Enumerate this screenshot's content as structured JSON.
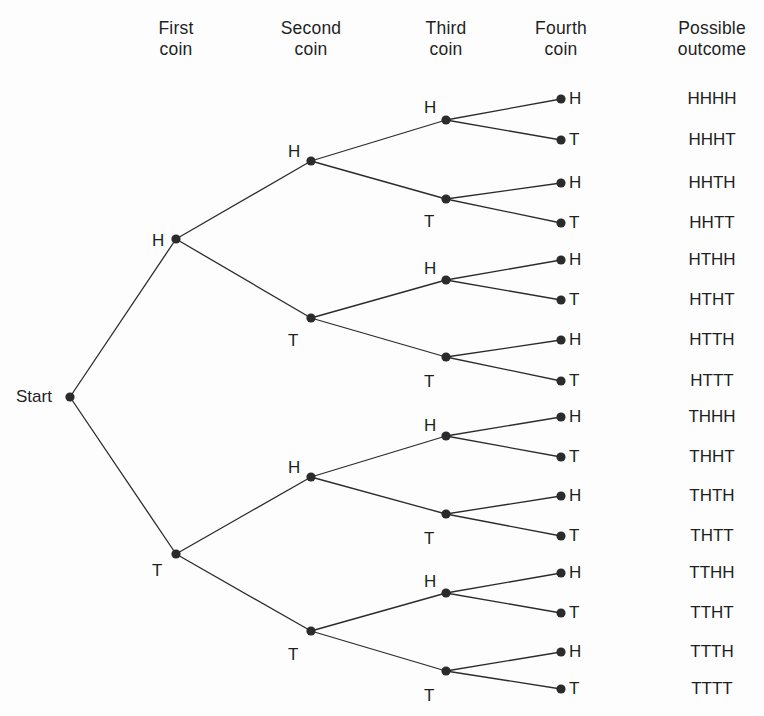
{
  "diagram": {
    "start_label": "Start",
    "headers": [
      {
        "id": "first-coin",
        "line1": "First",
        "line2": "coin",
        "x": 176,
        "y": 18
      },
      {
        "id": "second-coin",
        "line1": "Second",
        "line2": "coin",
        "x": 311,
        "y": 18
      },
      {
        "id": "third-coin",
        "line1": "Third",
        "line2": "coin",
        "x": 446,
        "y": 18
      },
      {
        "id": "fourth-coin",
        "line1": "Fourth",
        "line2": "coin",
        "x": 561,
        "y": 18
      },
      {
        "id": "possible-outcome",
        "line1": "Possible",
        "line2": "outcome",
        "x": 712,
        "y": 18
      }
    ],
    "colors": {
      "node": "#2b2b2b",
      "edge": "#2b2b2b",
      "text": "#1f1f1f",
      "background": "#fdfdfd"
    },
    "geometry": {
      "start_x": 70,
      "start_y": 397,
      "col_x": [
        176,
        311,
        446,
        561
      ],
      "outcome_x": 712,
      "node_radius": 4.6,
      "edge_width": 1.3
    },
    "start_node": {
      "x": 70,
      "y": 397
    },
    "level1": [
      {
        "id": "H",
        "label": "H",
        "x": 176,
        "y": 239,
        "label_x": 152,
        "label_y": 232,
        "label_pos": "left-above"
      },
      {
        "id": "T",
        "label": "T",
        "x": 176,
        "y": 554,
        "label_x": 152,
        "label_y": 562,
        "label_pos": "left-below"
      }
    ],
    "level2": [
      {
        "id": "HH",
        "label": "H",
        "x": 311,
        "y": 161,
        "label_x": 288,
        "label_y": 143,
        "label_pos": "left-above"
      },
      {
        "id": "HT",
        "label": "T",
        "x": 311,
        "y": 318,
        "label_x": 288,
        "label_y": 332,
        "label_pos": "left-below"
      },
      {
        "id": "TH",
        "label": "H",
        "x": 311,
        "y": 477,
        "label_x": 288,
        "label_y": 459,
        "label_pos": "left-above"
      },
      {
        "id": "TT",
        "label": "T",
        "x": 311,
        "y": 631,
        "label_x": 288,
        "label_y": 646,
        "label_pos": "left-below"
      }
    ],
    "level3": [
      {
        "id": "HHH",
        "label": "H",
        "x": 446,
        "y": 120,
        "label_x": 424,
        "label_y": 99,
        "label_pos": "left-above"
      },
      {
        "id": "HHT",
        "label": "T",
        "x": 446,
        "y": 199,
        "label_x": 424,
        "label_y": 213,
        "label_pos": "left-below"
      },
      {
        "id": "HTH",
        "label": "H",
        "x": 446,
        "y": 280,
        "label_x": 424,
        "label_y": 260,
        "label_pos": "left-above"
      },
      {
        "id": "HTT",
        "label": "T",
        "x": 446,
        "y": 357,
        "label_x": 424,
        "label_y": 373,
        "label_pos": "left-below"
      },
      {
        "id": "THH",
        "label": "H",
        "x": 446,
        "y": 436,
        "label_x": 424,
        "label_y": 417,
        "label_pos": "left-above"
      },
      {
        "id": "THT",
        "label": "T",
        "x": 446,
        "y": 514,
        "label_x": 424,
        "label_y": 530,
        "label_pos": "left-below"
      },
      {
        "id": "TTH",
        "label": "H",
        "x": 446,
        "y": 593,
        "label_x": 424,
        "label_y": 573,
        "label_pos": "left-above"
      },
      {
        "id": "TTT",
        "label": "T",
        "x": 446,
        "y": 671,
        "label_x": 424,
        "label_y": 687,
        "label_pos": "left-below"
      }
    ],
    "leaves": [
      {
        "id": "HHHH",
        "label": "H",
        "x": 561,
        "y": 99,
        "outcome": "HHHH"
      },
      {
        "id": "HHHT",
        "label": "T",
        "x": 561,
        "y": 140,
        "outcome": "HHHT"
      },
      {
        "id": "HHTH",
        "label": "H",
        "x": 561,
        "y": 183,
        "outcome": "HHTH"
      },
      {
        "id": "HHTT",
        "label": "T",
        "x": 561,
        "y": 223,
        "outcome": "HHTT"
      },
      {
        "id": "HTHH",
        "label": "H",
        "x": 561,
        "y": 260,
        "outcome": "HTHH"
      },
      {
        "id": "HTHT",
        "label": "T",
        "x": 561,
        "y": 300,
        "outcome": "HTHT"
      },
      {
        "id": "HTTH",
        "label": "H",
        "x": 561,
        "y": 340,
        "outcome": "HTTH"
      },
      {
        "id": "HTTT",
        "label": "T",
        "x": 561,
        "y": 381,
        "outcome": "HTTT"
      },
      {
        "id": "THHH",
        "label": "H",
        "x": 561,
        "y": 417,
        "outcome": "THHH"
      },
      {
        "id": "THHT",
        "label": "T",
        "x": 561,
        "y": 457,
        "outcome": "THHT"
      },
      {
        "id": "THTH",
        "label": "H",
        "x": 561,
        "y": 496,
        "outcome": "THTH"
      },
      {
        "id": "THTT",
        "label": "T",
        "x": 561,
        "y": 536,
        "outcome": "THTT"
      },
      {
        "id": "TTHH",
        "label": "H",
        "x": 561,
        "y": 573,
        "outcome": "TTHH"
      },
      {
        "id": "TTHT",
        "label": "T",
        "x": 561,
        "y": 613,
        "outcome": "TTHT"
      },
      {
        "id": "TTTH",
        "label": "H",
        "x": 561,
        "y": 652,
        "outcome": "TTTH"
      },
      {
        "id": "TTTT",
        "label": "T",
        "x": 561,
        "y": 689,
        "outcome": "TTTT"
      }
    ]
  }
}
